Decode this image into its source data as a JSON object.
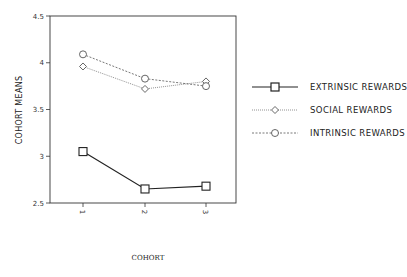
{
  "chart_data": {
    "type": "line",
    "title": "",
    "xlabel": "COHORT",
    "ylabel": "COHORT MEANS",
    "categories": [
      "1",
      "2",
      "3"
    ],
    "ylim": [
      2.5,
      4.5
    ],
    "yticks": [
      "2.5",
      "3",
      "3.5",
      "4",
      "4.5"
    ],
    "grid": false,
    "legend_position": "right",
    "series": [
      {
        "name": "EXTRINSIC REWARDS",
        "marker": "square",
        "line": "solid",
        "values": [
          3.05,
          2.65,
          2.68
        ]
      },
      {
        "name": "SOCIAL REWARDS",
        "marker": "diamond",
        "line": "dotted",
        "values": [
          3.96,
          3.72,
          3.8
        ]
      },
      {
        "name": "INTRINSIC REWARDS",
        "marker": "circle",
        "line": "dashed",
        "values": [
          4.09,
          3.83,
          3.75
        ]
      }
    ]
  },
  "colors": {
    "line": "#222222",
    "dotted": "#777777",
    "frame": "#333333"
  }
}
